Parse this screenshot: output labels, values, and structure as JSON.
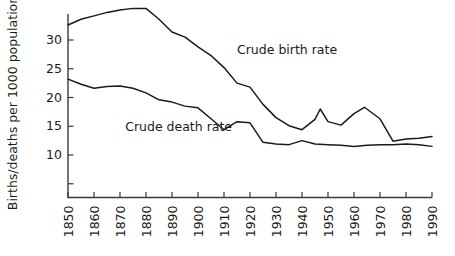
{
  "chart_data": {
    "type": "line",
    "title": "",
    "xlabel": "",
    "ylabel": "Births/deaths per 1000 population",
    "xlim": [
      1850,
      1990
    ],
    "ylim": [
      0,
      36
    ],
    "grid": false,
    "legend_position": "inline-annotation",
    "x_ticks": [
      1850,
      1860,
      1870,
      1880,
      1890,
      1900,
      1910,
      1920,
      1930,
      1940,
      1950,
      1960,
      1970,
      1980,
      1990
    ],
    "x_tick_labels": [
      "1850",
      "1860",
      "1870",
      "1880",
      "1890",
      "1900",
      "1910",
      "1920",
      "1930",
      "1940",
      "1950",
      "1960",
      "1970",
      "1980",
      "1990"
    ],
    "y_ticks": [
      5,
      10,
      15,
      20,
      25,
      30
    ],
    "y_tick_labels": [
      "",
      "10",
      "15",
      "20",
      "25",
      "30"
    ],
    "annotations": [
      {
        "text": "Crude birth rate",
        "x": 1915,
        "y": 27.5
      },
      {
        "text": "Crude death rate",
        "x": 1872,
        "y": 14.2
      }
    ],
    "series": [
      {
        "name": "Crude birth rate",
        "label": "Crude birth rate",
        "color": "#1a1a1a",
        "x": [
          1850,
          1855,
          1860,
          1865,
          1870,
          1875,
          1880,
          1885,
          1890,
          1895,
          1900,
          1905,
          1910,
          1915,
          1920,
          1925,
          1930,
          1935,
          1940,
          1945,
          1947,
          1950,
          1955,
          1960,
          1964,
          1970,
          1975,
          1980,
          1985,
          1990
        ],
        "y": [
          32.6,
          33.6,
          34.2,
          34.8,
          35.2,
          35.5,
          35.5,
          33.6,
          31.4,
          30.5,
          28.8,
          27.3,
          25.2,
          22.5,
          21.8,
          18.8,
          16.5,
          15.1,
          14.4,
          16.2,
          18.0,
          15.8,
          15.2,
          17.2,
          18.3,
          16.3,
          12.4,
          12.8,
          12.9,
          13.2
        ]
      },
      {
        "name": "Crude death rate",
        "label": "Crude death rate",
        "color": "#1a1a1a",
        "x": [
          1850,
          1855,
          1860,
          1865,
          1870,
          1875,
          1880,
          1885,
          1890,
          1895,
          1900,
          1905,
          1910,
          1915,
          1920,
          1925,
          1930,
          1935,
          1940,
          1945,
          1950,
          1955,
          1960,
          1965,
          1970,
          1975,
          1980,
          1985,
          1990
        ],
        "y": [
          23.2,
          22.3,
          21.6,
          21.9,
          22.0,
          21.6,
          20.8,
          19.6,
          19.2,
          18.5,
          18.2,
          16.3,
          14.4,
          15.8,
          15.6,
          12.2,
          11.9,
          11.8,
          12.5,
          11.9,
          11.8,
          11.7,
          11.5,
          11.7,
          11.8,
          11.8,
          11.9,
          11.8,
          11.5
        ]
      }
    ]
  }
}
